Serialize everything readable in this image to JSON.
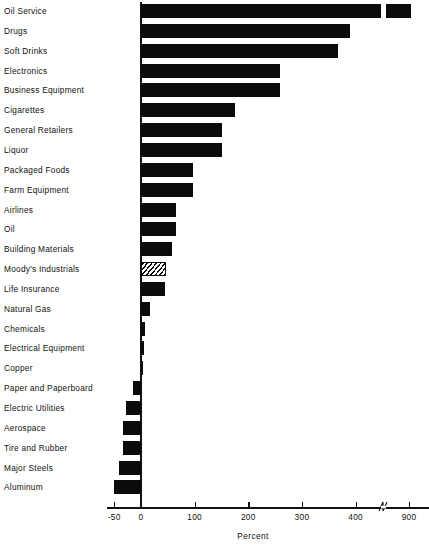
{
  "chart_data": {
    "type": "bar",
    "orientation": "horizontal",
    "title": "",
    "xlabel": "Percent",
    "ylabel": "",
    "xlim": [
      -60,
      950
    ],
    "grid": false,
    "legend": null,
    "axis_break": {
      "after": 430,
      "before": 880,
      "label": "axis-break-marker"
    },
    "tick_labels": [
      "-50",
      "0",
      "100",
      "200",
      "300",
      "400",
      "900"
    ],
    "tick_values": [
      -50,
      0,
      100,
      200,
      300,
      400,
      900
    ],
    "categories": [
      "Oil Service",
      "Drugs",
      "Soft Drinks",
      "Electronics",
      "Business Equipment",
      "Cigarettes",
      "General Retailers",
      "Liquor",
      "Packaged Foods",
      "Farm Equipment",
      "Airlines",
      "Oil",
      "Building Materials",
      "Moody's Industrials",
      "Life Insurance",
      "Natural Gas",
      "Chemicals",
      "Electrical Equipment",
      "Copper",
      "Paper and Paperboard",
      "Electric Utilities",
      "Aerospace",
      "Tire and Rubber",
      "Major Steels",
      "Aluminum"
    ],
    "values": [
      920,
      390,
      368,
      260,
      260,
      175,
      151,
      151,
      97,
      97,
      65,
      65,
      58,
      47,
      45,
      17,
      7,
      6,
      2,
      -15,
      -28,
      -33,
      -33,
      -41,
      -50
    ],
    "highlight_category": "Moody's Industrials",
    "highlight_style": "hatched",
    "bar_color": "#0b0b0b"
  }
}
